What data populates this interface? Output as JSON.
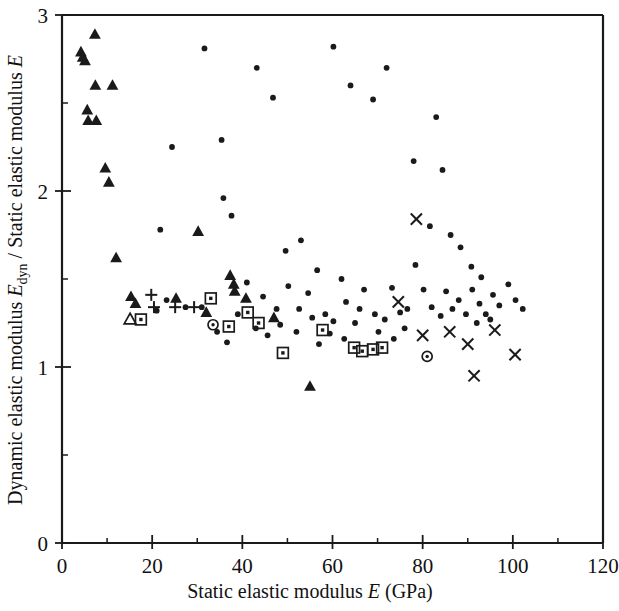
{
  "chart_data": {
    "type": "scatter",
    "title": "",
    "xlabel": "Static elastic modulus E (GPa)",
    "ylabel": "Dynamic elastic modulus Edyn / Static elastic modulus E",
    "xlabel_parts": {
      "pre": "Static elastic modulus ",
      "sym": "E",
      "post": " (GPa)"
    },
    "ylabel_parts": {
      "pre": "Dynamic elastic modulus ",
      "sym1": "E",
      "sub1": "dyn",
      "mid": " / Static elastic modulus ",
      "sym2": "E"
    },
    "xlim": [
      0,
      120
    ],
    "ylim": [
      0,
      3
    ],
    "xticks": [
      0,
      20,
      40,
      60,
      80,
      100,
      120
    ],
    "xticklabels": [
      "0",
      "20",
      "40",
      "60",
      "80",
      "100",
      "120"
    ],
    "yticks": [
      0,
      1,
      2,
      3
    ],
    "yticklabels": [
      "0",
      "1",
      "2",
      "3"
    ],
    "x_minor_step": 10,
    "y_minor_step": 0.5,
    "grid": false,
    "legend": null,
    "marker_color": "#1a1a1a",
    "background": "#ffffff",
    "series": [
      {
        "name": "filled-triangle",
        "marker": "triangle",
        "points": [
          [
            4.2,
            2.79
          ],
          [
            4.6,
            2.76
          ],
          [
            5.1,
            2.74
          ],
          [
            7.3,
            2.89
          ],
          [
            5.6,
            2.46
          ],
          [
            7.4,
            2.6
          ],
          [
            5.8,
            2.4
          ],
          [
            7.6,
            2.4
          ],
          [
            11.2,
            2.6
          ],
          [
            9.6,
            2.13
          ],
          [
            10.4,
            2.05
          ],
          [
            12.0,
            1.62
          ],
          [
            15.3,
            1.4
          ],
          [
            16.3,
            1.36
          ],
          [
            25.3,
            1.39
          ],
          [
            30.2,
            1.77
          ],
          [
            32.0,
            1.31
          ],
          [
            37.3,
            1.52
          ],
          [
            38.1,
            1.47
          ],
          [
            38.3,
            1.43
          ],
          [
            40.8,
            1.39
          ],
          [
            47.0,
            1.28
          ],
          [
            55.0,
            0.89
          ]
        ]
      },
      {
        "name": "open-triangle",
        "marker": "triangle-open",
        "points": [
          [
            15.1,
            1.27
          ]
        ]
      },
      {
        "name": "plus",
        "marker": "plus",
        "points": [
          [
            19.8,
            1.41
          ],
          [
            20.4,
            1.34
          ],
          [
            25.1,
            1.34
          ],
          [
            29.3,
            1.34
          ]
        ]
      },
      {
        "name": "open-square",
        "marker": "square",
        "points": [
          [
            17.5,
            1.27
          ],
          [
            33.0,
            1.39
          ],
          [
            41.2,
            1.31
          ],
          [
            37.0,
            1.23
          ],
          [
            43.6,
            1.25
          ],
          [
            49.0,
            1.08
          ],
          [
            64.8,
            1.11
          ],
          [
            66.6,
            1.09
          ],
          [
            69.0,
            1.1
          ],
          [
            71.0,
            1.11
          ],
          [
            57.8,
            1.21
          ]
        ]
      },
      {
        "name": "circle",
        "marker": "circle",
        "points": [
          [
            33.5,
            1.24
          ],
          [
            81.0,
            1.06
          ]
        ]
      },
      {
        "name": "cross",
        "marker": "cross",
        "points": [
          [
            78.6,
            1.84
          ],
          [
            74.6,
            1.37
          ],
          [
            80.0,
            1.18
          ],
          [
            86.0,
            1.2
          ],
          [
            90.0,
            1.13
          ],
          [
            91.4,
            0.95
          ],
          [
            96.0,
            1.21
          ],
          [
            100.5,
            1.07
          ]
        ]
      },
      {
        "name": "dot",
        "marker": "dot",
        "points": [
          [
            24.4,
            2.25
          ],
          [
            31.6,
            2.81
          ],
          [
            35.4,
            2.29
          ],
          [
            43.2,
            2.7
          ],
          [
            46.8,
            2.53
          ],
          [
            60.2,
            2.82
          ],
          [
            64.0,
            2.6
          ],
          [
            69.0,
            2.52
          ],
          [
            72.0,
            2.7
          ],
          [
            83.0,
            2.42
          ],
          [
            84.4,
            2.12
          ],
          [
            78.0,
            2.17
          ],
          [
            21.8,
            1.78
          ],
          [
            35.8,
            1.96
          ],
          [
            37.6,
            1.86
          ],
          [
            49.6,
            1.66
          ],
          [
            53.0,
            1.72
          ],
          [
            56.6,
            1.55
          ],
          [
            41.0,
            1.48
          ],
          [
            44.6,
            1.4
          ],
          [
            47.6,
            1.33
          ],
          [
            50.2,
            1.46
          ],
          [
            52.6,
            1.33
          ],
          [
            54.6,
            1.42
          ],
          [
            55.5,
            1.28
          ],
          [
            58.4,
            1.3
          ],
          [
            60.2,
            1.26
          ],
          [
            62.0,
            1.5
          ],
          [
            63.0,
            1.37
          ],
          [
            65.0,
            1.25
          ],
          [
            67.0,
            1.44
          ],
          [
            69.4,
            1.3
          ],
          [
            71.6,
            1.27
          ],
          [
            73.2,
            1.45
          ],
          [
            75.0,
            1.31
          ],
          [
            76.6,
            1.33
          ],
          [
            78.4,
            1.58
          ],
          [
            80.2,
            1.44
          ],
          [
            82.0,
            1.34
          ],
          [
            84.0,
            1.29
          ],
          [
            85.2,
            1.43
          ],
          [
            86.6,
            1.33
          ],
          [
            88.0,
            1.38
          ],
          [
            89.6,
            1.3
          ],
          [
            91.0,
            1.44
          ],
          [
            92.6,
            1.36
          ],
          [
            94.0,
            1.3
          ],
          [
            95.6,
            1.41
          ],
          [
            97.0,
            1.35
          ],
          [
            99.0,
            1.47
          ],
          [
            100.6,
            1.38
          ],
          [
            102.2,
            1.33
          ],
          [
            88.4,
            1.68
          ],
          [
            90.8,
            1.57
          ],
          [
            93.0,
            1.51
          ],
          [
            86.2,
            1.75
          ],
          [
            81.6,
            1.8
          ],
          [
            43.0,
            1.22
          ],
          [
            45.6,
            1.18
          ],
          [
            39.0,
            1.3
          ],
          [
            34.4,
            1.2
          ],
          [
            36.6,
            1.14
          ],
          [
            31.0,
            1.34
          ],
          [
            27.4,
            1.34
          ],
          [
            23.2,
            1.38
          ],
          [
            21.0,
            1.32
          ],
          [
            57.0,
            1.13
          ],
          [
            59.4,
            1.19
          ],
          [
            62.6,
            1.16
          ],
          [
            73.6,
            1.16
          ],
          [
            76.0,
            1.22
          ],
          [
            70.2,
            1.2
          ],
          [
            52.0,
            1.2
          ],
          [
            48.4,
            1.24
          ],
          [
            66.0,
            1.33
          ],
          [
            92.0,
            1.25
          ],
          [
            95.0,
            1.27
          ]
        ]
      }
    ]
  },
  "axes": {
    "x_axis_name": "x-axis",
    "y_axis_name": "y-axis"
  }
}
